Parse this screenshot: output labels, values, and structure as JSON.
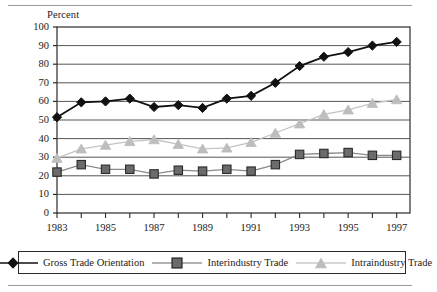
{
  "chart_data": {
    "type": "line",
    "title": "",
    "subtitle": "",
    "xlabel": "",
    "ylabel": "Percent",
    "ylim": [
      0,
      100
    ],
    "ytick_step": 10,
    "yticks": [
      "0",
      "10",
      "20",
      "30",
      "40",
      "50",
      "60",
      "70",
      "80",
      "90",
      "100"
    ],
    "grid": "horizontal",
    "legend_position": "bottom",
    "x": [
      1983,
      1984,
      1985,
      1986,
      1987,
      1988,
      1989,
      1990,
      1991,
      1992,
      1993,
      1994,
      1995,
      1996,
      1997
    ],
    "xtick_labels": [
      "1983",
      "",
      "1985",
      "",
      "1987",
      "",
      "1989",
      "",
      "1991",
      "",
      "1993",
      "",
      "1995",
      "",
      "1997"
    ],
    "xticks_labeled": [
      "1983",
      "1985",
      "1987",
      "1989",
      "1991",
      "1993",
      "1995",
      "1997"
    ],
    "series": [
      {
        "name": "Gross Trade Orientation",
        "marker": "diamond",
        "color": "#111111",
        "line_color": "#111111",
        "values": [
          51.5,
          59.5,
          60,
          61.5,
          57,
          58,
          56.5,
          61.5,
          63,
          70,
          79,
          84,
          86.5,
          90,
          92
        ]
      },
      {
        "name": "Interindustry Trade",
        "marker": "square",
        "color": "#6b6b6b",
        "line_color": "#8a8a8a",
        "values": [
          22,
          26,
          23.5,
          23.5,
          21,
          23,
          22.5,
          23.5,
          22.5,
          26,
          31.5,
          32,
          32.5,
          31,
          31
        ]
      },
      {
        "name": "Intraindustry Trade",
        "marker": "triangle",
        "color": "#bdbdbd",
        "line_color": "#c4c4c4",
        "values": [
          29.5,
          34.5,
          36.5,
          38.5,
          39.5,
          37,
          34.5,
          35,
          38,
          43,
          48,
          53,
          55.5,
          59,
          61
        ]
      }
    ]
  }
}
